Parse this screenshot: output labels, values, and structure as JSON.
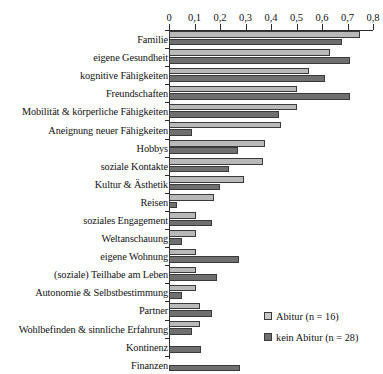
{
  "chart_data": {
    "type": "bar",
    "orientation": "horizontal",
    "title": "",
    "xlabel": "",
    "ylabel": "",
    "xlim": [
      0,
      0.8
    ],
    "xticks": [
      "0",
      "0,1",
      "0,2",
      "0,3",
      "0,4",
      "0,5",
      "0,6",
      "0,7",
      "0,8"
    ],
    "xtick_values": [
      0,
      0.1,
      0.2,
      0.3,
      0.4,
      0.5,
      0.6,
      0.7,
      0.8
    ],
    "grid": false,
    "legend_position": "bottom-right",
    "categories": [
      "Familie",
      "eigene Gesundheit",
      "kognitive Fähigkeiten",
      "Freundschaften",
      "Mobilität & körperliche Fähigkeiten",
      "Aneignung neuer Fähigkeiten",
      "Hobbys",
      "soziale Kontakte",
      "Kultur & Ästhetik",
      "Reisen",
      "soziales Engagement",
      "Weltanschauung",
      "eigene Wohnung",
      "(soziale) Teilhabe am Leben",
      "Autonomie & Selbstbestimmung",
      "Partner",
      "Wohlbefinden & sinnliche Erfahrung",
      "Kontinenz",
      "Finanzen"
    ],
    "series": [
      {
        "name": "Abitur (n = 16)",
        "color": "#b9b9b9",
        "values": [
          0.75,
          0.63,
          0.55,
          0.5,
          0.5,
          0.44,
          0.375,
          0.37,
          0.295,
          0.175,
          0.105,
          0.105,
          0.105,
          0.105,
          0.105,
          0.12,
          0.12,
          0.0,
          0.0
        ]
      },
      {
        "name": "kein Abitur (n = 28)",
        "color": "#6f6f6f",
        "values": [
          0.68,
          0.71,
          0.61,
          0.71,
          0.43,
          0.09,
          0.27,
          0.235,
          0.2,
          0.03,
          0.17,
          0.05,
          0.275,
          0.19,
          0.05,
          0.17,
          0.09,
          0.125,
          0.28
        ]
      }
    ]
  },
  "legend": {
    "items": [
      {
        "label": "Abitur (n = 16)",
        "swatch": "light"
      },
      {
        "label": "kein Abitur (n = 28)",
        "swatch": "dark"
      }
    ]
  }
}
